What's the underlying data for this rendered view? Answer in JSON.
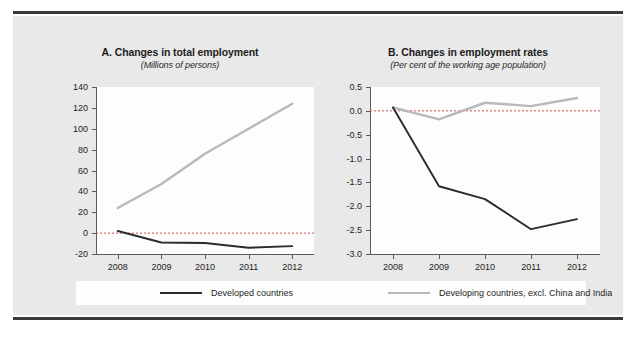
{
  "figure": {
    "background_color": "#e9e9e9",
    "plot_background_color": "#fdfdfd",
    "rule_color": "#3a3a3a"
  },
  "legend": {
    "items": [
      {
        "label": "Developed countries",
        "color": "#2b2b2b",
        "swatch": "line-swatch-dark"
      },
      {
        "label": "Developing countries, excl. China and India",
        "color": "#b9b9b9",
        "swatch": "line-swatch-gray"
      }
    ]
  },
  "source": {
    "text": ""
  },
  "chart_data": [
    {
      "id": "A",
      "type": "line",
      "title": "A. Changes in total employment",
      "subtitle": "(Millions of persons)",
      "xlabel": "",
      "ylabel": "",
      "categories": [
        "2008",
        "2009",
        "2010",
        "2011",
        "2012"
      ],
      "x": [
        2008,
        2009,
        2010,
        2011,
        2012
      ],
      "ylim": [
        -20,
        140
      ],
      "yticks": [
        140,
        120,
        100,
        80,
        60,
        40,
        20,
        0,
        -20
      ],
      "ytick_labels": [
        "140",
        "120",
        "100",
        "80",
        "60",
        "40",
        "20",
        "0",
        "-20"
      ],
      "xtick_labels": [
        "2008",
        "2009",
        "2010",
        "2011",
        "2012"
      ],
      "grid": false,
      "zero_line": true,
      "legend_position": "bottom",
      "series": [
        {
          "name": "Developed countries",
          "color": "#2b2b2b",
          "values": [
            2,
            -9,
            -9.5,
            -14,
            -12.5
          ]
        },
        {
          "name": "Developing countries, excl. China and India",
          "color": "#b9b9b9",
          "values": [
            24,
            47,
            76,
            100,
            124
          ]
        }
      ]
    },
    {
      "id": "B",
      "type": "line",
      "title": "B. Changes in employment rates",
      "subtitle": "(Per cent of the working age population)",
      "xlabel": "",
      "ylabel": "",
      "categories": [
        "2008",
        "2009",
        "2010",
        "2011",
        "2012"
      ],
      "x": [
        2008,
        2009,
        2010,
        2011,
        2012
      ],
      "ylim": [
        -3.0,
        0.5
      ],
      "yticks": [
        0.5,
        0.0,
        -0.5,
        -1.0,
        -1.5,
        -2.0,
        -2.5,
        -3.0
      ],
      "ytick_labels": [
        "0.5",
        "0.0",
        "-0.5",
        "-1.0",
        "-1.5",
        "-2.0",
        "-2.5",
        "-3.0"
      ],
      "xtick_labels": [
        "2008",
        "2009",
        "2010",
        "2011",
        "2012"
      ],
      "grid": false,
      "zero_line": true,
      "legend_position": "bottom",
      "series": [
        {
          "name": "Developed countries",
          "color": "#2b2b2b",
          "values": [
            0.07,
            -1.58,
            -1.85,
            -2.48,
            -2.27
          ]
        },
        {
          "name": "Developing countries, excl. China and India",
          "color": "#b9b9b9",
          "values": [
            0.07,
            -0.18,
            0.17,
            0.1,
            0.27
          ]
        }
      ]
    }
  ]
}
